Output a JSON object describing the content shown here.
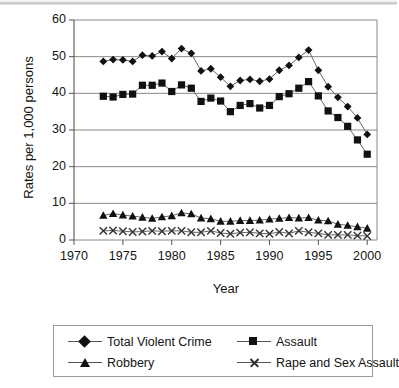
{
  "chart_data": {
    "type": "line",
    "title": "",
    "xlabel": "Year",
    "ylabel": "Rates per 1,000 persons",
    "xlim": [
      1970,
      2001
    ],
    "ylim": [
      0,
      60
    ],
    "xticks": [
      1970,
      1975,
      1980,
      1985,
      1990,
      1995,
      2000
    ],
    "xtick_labels": [
      "1970",
      "1975",
      "1980",
      "1985",
      "1990",
      "1995",
      "2000"
    ],
    "yticks": [
      0,
      10,
      20,
      30,
      40,
      50,
      60
    ],
    "ytick_labels": [
      "0",
      "10",
      "20",
      "30",
      "40",
      "50",
      "60"
    ],
    "grid": "horizontal",
    "legend_position": "bottom",
    "x": [
      1973,
      1974,
      1975,
      1976,
      1977,
      1978,
      1979,
      1980,
      1981,
      1982,
      1983,
      1984,
      1985,
      1986,
      1987,
      1988,
      1989,
      1990,
      1991,
      1992,
      1993,
      1994,
      1995,
      1996,
      1997,
      1998,
      1999,
      2000
    ],
    "series": [
      {
        "name": "Total Violent Crime",
        "marker": "diamond",
        "values": [
          48.7,
          49.2,
          49.1,
          48.7,
          50.4,
          50.2,
          51.4,
          49.5,
          52.2,
          50.9,
          46.1,
          46.7,
          44.4,
          41.9,
          43.5,
          43.8,
          43.3,
          43.9,
          46.3,
          47.6,
          49.8,
          51.8,
          46.3,
          41.8,
          38.9,
          36.4,
          33.3,
          28.8
        ]
      },
      {
        "name": "Assault",
        "marker": "square",
        "values": [
          39.2,
          39.0,
          39.7,
          39.8,
          42.2,
          42.2,
          42.8,
          40.5,
          42.3,
          41.4,
          37.8,
          38.7,
          37.9,
          35.0,
          36.7,
          37.2,
          36.0,
          36.7,
          39.1,
          39.9,
          41.4,
          43.2,
          39.3,
          35.2,
          33.4,
          31.0,
          27.3,
          23.4
        ]
      },
      {
        "name": "Robbery",
        "marker": "triangle",
        "values": [
          6.7,
          7.2,
          6.8,
          6.5,
          6.2,
          5.9,
          6.3,
          6.6,
          7.4,
          7.1,
          6.0,
          5.8,
          5.1,
          5.1,
          5.3,
          5.3,
          5.4,
          5.7,
          5.9,
          6.1,
          6.0,
          6.1,
          5.4,
          5.2,
          4.3,
          4.0,
          3.6,
          3.2
        ]
      },
      {
        "name": "Rape and Sex Assault",
        "marker": "cross",
        "values": [
          2.5,
          2.6,
          2.4,
          2.2,
          2.3,
          2.5,
          2.4,
          2.5,
          2.5,
          2.1,
          2.1,
          2.5,
          1.9,
          1.7,
          2.0,
          2.1,
          1.8,
          1.7,
          2.2,
          1.8,
          2.5,
          2.1,
          1.8,
          1.4,
          1.4,
          1.4,
          1.2,
          1.1
        ]
      }
    ]
  },
  "colors": {
    "line": "#666666",
    "marker": "#111111",
    "grid": "#7a7a7a",
    "axis": "#555555",
    "text": "#141414"
  }
}
